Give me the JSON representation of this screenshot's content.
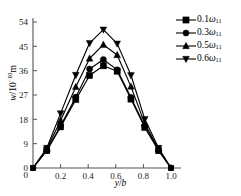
{
  "chart_data": {
    "type": "line",
    "title": "",
    "xlabel": "y/b",
    "ylabel": "w/10⁻¹⁰m",
    "ylabel_parts": {
      "var": "w",
      "unit_prefix": "/10",
      "exponent": "-10",
      "unit": "m"
    },
    "xlabel_parts": {
      "num": "y",
      "slash": "/",
      "den": "b"
    },
    "xlim": [
      0,
      1.0
    ],
    "ylim": [
      0,
      54
    ],
    "xticks": [
      0,
      0.2,
      0.4,
      0.6,
      0.8,
      1.0
    ],
    "xticklabels": [
      "0",
      "0.2",
      "0.4",
      "0.6",
      "0.8",
      "1.0"
    ],
    "yticks": [
      0,
      9,
      18,
      27,
      36,
      45,
      54
    ],
    "yticklabels": [
      "0",
      "9",
      "18",
      "27",
      "36",
      "45",
      "54"
    ],
    "grid": false,
    "legend_position": "top-right",
    "x": [
      0.0,
      0.1,
      0.2,
      0.31,
      0.41,
      0.51,
      0.61,
      0.71,
      0.81,
      0.91,
      1.0
    ],
    "series": [
      {
        "name": "0.1ω₁₁",
        "coefficient": "0.1",
        "symbol": "ω",
        "subscript": "11",
        "marker": "square",
        "color": "#000000",
        "values": [
          0.0,
          6.4,
          15.2,
          25.3,
          34.2,
          37.8,
          35.8,
          25.5,
          15.0,
          6.4,
          0.0
        ]
      },
      {
        "name": "0.3ω₁₁",
        "coefficient": "0.3",
        "symbol": "ω",
        "subscript": "11",
        "marker": "circle",
        "color": "#000000",
        "values": [
          0.0,
          6.6,
          15.6,
          26.2,
          36.6,
          40.1,
          36.3,
          26.1,
          15.4,
          6.6,
          0.0
        ]
      },
      {
        "name": "0.5ω₁₁",
        "coefficient": "0.5",
        "symbol": "ω",
        "subscript": "11",
        "marker": "triangle-up",
        "color": "#000000",
        "values": [
          0.0,
          7.0,
          17.6,
          30.0,
          40.5,
          45.6,
          41.8,
          30.1,
          16.4,
          7.0,
          0.0
        ]
      },
      {
        "name": "0.6ω₁₁",
        "coefficient": "0.6",
        "symbol": "ω",
        "subscript": "11",
        "marker": "triangle-down",
        "color": "#000000",
        "values": [
          0.0,
          7.4,
          20.2,
          34.4,
          46.2,
          51.2,
          46.0,
          34.3,
          18.1,
          7.4,
          0.0
        ]
      }
    ]
  },
  "legend": {
    "entries": [
      {
        "label": "0.1ω₁₁",
        "coefficient": "0.1",
        "symbol": "ω",
        "subscript": "11",
        "marker": "square"
      },
      {
        "label": "0.3ω₁₁",
        "coefficient": "0.3",
        "symbol": "ω",
        "subscript": "11",
        "marker": "circle"
      },
      {
        "label": "0.5ω₁₁",
        "coefficient": "0.5",
        "symbol": "ω",
        "subscript": "11",
        "marker": "triangle-up"
      },
      {
        "label": "0.6ω₁₁",
        "coefficient": "0.6",
        "symbol": "ω",
        "subscript": "11",
        "marker": "triangle-down"
      }
    ]
  },
  "colors": {
    "axis": "#555555",
    "curve": "#000000",
    "background": "#ffffff"
  }
}
